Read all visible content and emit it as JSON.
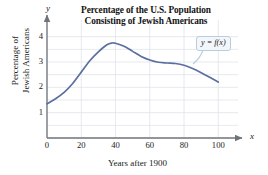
{
  "chart_data": {
    "type": "line",
    "title": "Percentage of the U.S. Population Consisting of Jewish Americans",
    "title_line1": "Percentage of the U.S. Population",
    "title_line2": "Consisting of Jewish Americans",
    "xlabel": "Years after 1900",
    "ylabel": "Percentage of Jewish Americans",
    "ylabel_line1": "Percentage of",
    "ylabel_line2": "Jewish Americans",
    "x_axis_letter": "x",
    "y_axis_letter": "y",
    "xlim": [
      0,
      108
    ],
    "ylim": [
      0,
      4.5
    ],
    "xticks": [
      0,
      20,
      40,
      60,
      80,
      100
    ],
    "yticks": [
      1,
      2,
      3,
      4
    ],
    "grid": true,
    "legend": "none",
    "annotation": "y = f(x)",
    "series": [
      {
        "name": "y = f(x)",
        "color": "#5b6fa0",
        "x": [
          0,
          5,
          10,
          15,
          20,
          25,
          30,
          35,
          38,
          40,
          45,
          50,
          55,
          60,
          65,
          70,
          75,
          80,
          85,
          90,
          95,
          100
        ],
        "values": [
          1.35,
          1.55,
          1.8,
          2.15,
          2.6,
          3.05,
          3.4,
          3.68,
          3.75,
          3.74,
          3.62,
          3.42,
          3.22,
          3.08,
          2.99,
          2.96,
          2.94,
          2.87,
          2.74,
          2.58,
          2.4,
          2.21
        ]
      }
    ]
  },
  "colors": {
    "curve": "#5b6fa0",
    "grid": "#dfe3e8",
    "axis": "#6f7377",
    "callout_border": "#b9cde2",
    "callout_fill": "#f3f7fb"
  }
}
